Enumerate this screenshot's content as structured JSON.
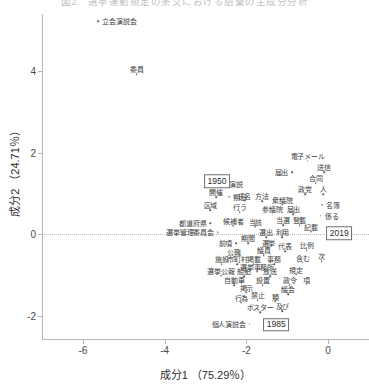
{
  "caption": "図2　選挙運動規定の条文における語彙の主成分分析",
  "chart_data": {
    "type": "scatter",
    "title": "",
    "xlabel": "成分1 （75.29％）",
    "ylabel": "成分2 （24.71％）",
    "xlim": [
      -7.0,
      1.0
    ],
    "ylim": [
      -2.6,
      5.4
    ],
    "xticks": [
      -6,
      -4,
      -2,
      0
    ],
    "yticks": [
      4,
      2,
      0,
      -2
    ],
    "grid": false,
    "legend": null,
    "zero_line_y": 0,
    "year_markers": [
      {
        "label": "1950",
        "x": -2.72,
        "y": 1.3
      },
      {
        "label": "2019",
        "x": 0.27,
        "y": 0.02
      },
      {
        "label": "1985",
        "x": -1.27,
        "y": -2.22
      }
    ],
    "points": [
      {
        "label": "立会演説会",
        "x": -5.62,
        "y": 5.22,
        "label_pos": "right"
      },
      {
        "label": "委員",
        "x": -4.68,
        "y": 3.92,
        "label_pos": "above"
      },
      {
        "label": "電子メール",
        "x": -0.5,
        "y": 1.8,
        "label_pos": "above"
      },
      {
        "label": "届出",
        "x": -0.88,
        "y": 1.52,
        "label_pos": "left"
      },
      {
        "label": "送信",
        "x": -0.1,
        "y": 1.52,
        "label_pos": "above"
      },
      {
        "label": "合同",
        "x": -0.3,
        "y": 1.25,
        "label_pos": "above"
      },
      {
        "label": "政党",
        "x": -0.56,
        "y": 0.98,
        "label_pos": "above"
      },
      {
        "label": "人",
        "x": -0.12,
        "y": 0.98,
        "label_pos": "above"
      },
      {
        "label": "期日",
        "x": -2.42,
        "y": 0.92,
        "label_pos": "right"
      },
      {
        "label": "氏名",
        "x": -2.05,
        "y": 0.82,
        "label_pos": "above"
      },
      {
        "label": "方法",
        "x": -1.62,
        "y": 0.8,
        "label_pos": "above"
      },
      {
        "label": "衆議院",
        "x": -1.12,
        "y": 0.72,
        "label_pos": "above"
      },
      {
        "label": "名簿",
        "x": -0.15,
        "y": 0.72,
        "label_pos": "right"
      },
      {
        "label": "演説",
        "x": -2.52,
        "y": 1.22,
        "label_pos": "right"
      },
      {
        "label": "開催",
        "x": -2.74,
        "y": 0.9,
        "label_pos": "above"
      },
      {
        "label": "区域",
        "x": -2.88,
        "y": 0.58,
        "label_pos": "above"
      },
      {
        "label": "行う",
        "x": -2.16,
        "y": 0.54,
        "label_pos": "above"
      },
      {
        "label": "参議院",
        "x": -1.36,
        "y": 0.5,
        "label_pos": "above"
      },
      {
        "label": "届出",
        "x": -0.85,
        "y": 0.48,
        "label_pos": "above"
      },
      {
        "label": "係る",
        "x": -0.18,
        "y": 0.45,
        "label_pos": "right"
      },
      {
        "label": "都道府県",
        "x": -2.88,
        "y": 0.26,
        "label_pos": "left"
      },
      {
        "label": "候補者",
        "x": -2.32,
        "y": 0.2,
        "label_pos": "above"
      },
      {
        "label": "当該",
        "x": -1.78,
        "y": 0.18,
        "label_pos": "above"
      },
      {
        "label": "当選",
        "x": -1.1,
        "y": 0.22,
        "label_pos": "above"
      },
      {
        "label": "登載",
        "x": -0.7,
        "y": 0.22,
        "label_pos": "above"
      },
      {
        "label": "記載",
        "x": -0.42,
        "y": 0.06,
        "label_pos": "above"
      },
      {
        "label": "選挙管理委員会",
        "x": -2.7,
        "y": 0.05,
        "label_pos": "left"
      },
      {
        "label": "選出",
        "x": -1.52,
        "y": -0.08,
        "label_pos": "above"
      },
      {
        "label": "利用",
        "x": -1.12,
        "y": -0.08,
        "label_pos": "above"
      },
      {
        "label": "前項",
        "x": -2.25,
        "y": -0.22,
        "label_pos": "left"
      },
      {
        "label": "期間",
        "x": -1.96,
        "y": -0.22,
        "label_pos": "above"
      },
      {
        "label": "選挙",
        "x": -1.46,
        "y": -0.34,
        "label_pos": "above"
      },
      {
        "label": "代表",
        "x": -1.05,
        "y": -0.42,
        "label_pos": "above"
      },
      {
        "label": "比例",
        "x": -0.52,
        "y": -0.4,
        "label_pos": "above"
      },
      {
        "label": "公職",
        "x": -2.3,
        "y": -0.56,
        "label_pos": "above"
      },
      {
        "label": "議員",
        "x": -1.58,
        "y": -0.52,
        "label_pos": "above"
      },
      {
        "label": "施設",
        "x": -2.6,
        "y": -0.74,
        "label_pos": "above"
      },
      {
        "label": "市町村",
        "x": -2.22,
        "y": -0.74,
        "label_pos": "above"
      },
      {
        "label": "掲載",
        "x": -1.82,
        "y": -0.74,
        "label_pos": "above"
      },
      {
        "label": "事務",
        "x": -1.32,
        "y": -0.74,
        "label_pos": "above"
      },
      {
        "label": "含む",
        "x": -0.62,
        "y": -0.7,
        "label_pos": "above"
      },
      {
        "label": "次",
        "x": -0.16,
        "y": -0.66,
        "label_pos": "above"
      },
      {
        "label": "選挙事務所",
        "x": -1.74,
        "y": -0.92,
        "label_pos": "above"
      },
      {
        "label": "選挙公報",
        "x": -2.62,
        "y": -1.02,
        "label_pos": "above"
      },
      {
        "label": "船舶",
        "x": -2.06,
        "y": -1.04,
        "label_pos": "above"
      },
      {
        "label": "放送",
        "x": -1.42,
        "y": -1.04,
        "label_pos": "above"
      },
      {
        "label": "規定",
        "x": -0.78,
        "y": -1.0,
        "label_pos": "above"
      },
      {
        "label": "自動車",
        "x": -2.3,
        "y": -1.26,
        "label_pos": "above"
      },
      {
        "label": "設置",
        "x": -1.6,
        "y": -1.26,
        "label_pos": "above"
      },
      {
        "label": "政令",
        "x": -0.94,
        "y": -1.26,
        "label_pos": "above"
      },
      {
        "label": "項",
        "x": -0.52,
        "y": -1.24,
        "label_pos": "above"
      },
      {
        "label": "掲示",
        "x": -2.0,
        "y": -1.44,
        "label_pos": "above"
      },
      {
        "label": "議会",
        "x": -0.98,
        "y": -1.48,
        "label_pos": "above"
      },
      {
        "label": "行為",
        "x": -2.12,
        "y": -1.68,
        "label_pos": "above"
      },
      {
        "label": "禁止",
        "x": -1.72,
        "y": -1.62,
        "label_pos": "above"
      },
      {
        "label": "類",
        "x": -1.3,
        "y": -1.66,
        "label_pos": "above"
      },
      {
        "label": "ポスター",
        "x": -1.66,
        "y": -1.92,
        "label_pos": "above"
      },
      {
        "label": "及び",
        "x": -1.12,
        "y": -1.9,
        "label_pos": "above"
      },
      {
        "label": "個人演説会",
        "x": -1.92,
        "y": -2.2,
        "label_pos": "left"
      }
    ]
  }
}
